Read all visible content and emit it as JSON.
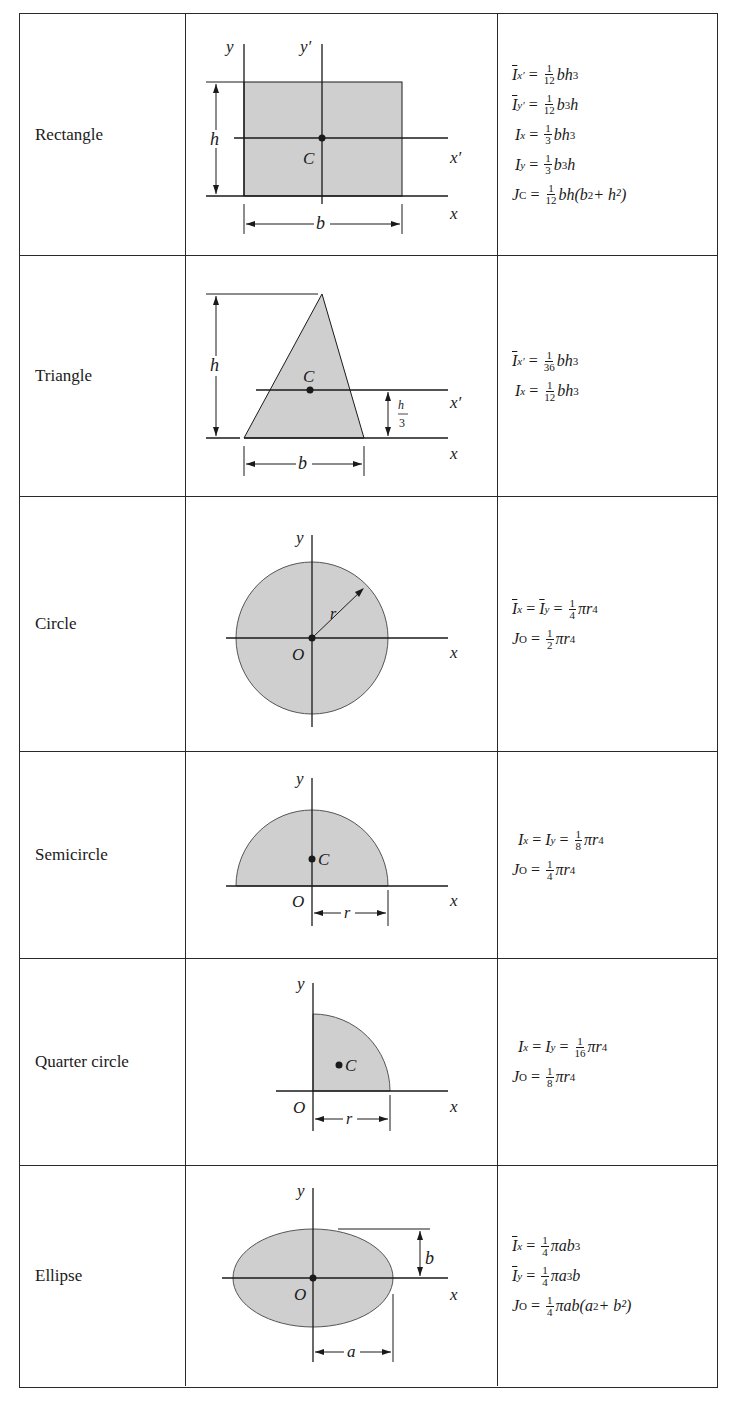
{
  "rows": [
    {
      "name": "Rectangle",
      "figure_labels": {
        "y": "y",
        "y_prime": "y′",
        "x": "x",
        "x_prime": "x′",
        "h": "h",
        "b": "b",
        "centroid": "C"
      },
      "formulas": [
        {
          "lhs": "I",
          "bar": true,
          "sub": "x′",
          "num": "1",
          "den": "12",
          "rhs": "bh",
          "rhs_sup": "3",
          "rhs_tail": ""
        },
        {
          "lhs": "I",
          "bar": true,
          "sub": "y′",
          "num": "1",
          "den": "12",
          "rhs": "b",
          "rhs_sup": "3",
          "rhs_tail": "h"
        },
        {
          "lhs": "I",
          "bar": false,
          "sub": "x",
          "num": "1",
          "den": "3",
          "rhs": "bh",
          "rhs_sup": "3",
          "rhs_tail": ""
        },
        {
          "lhs": "I",
          "bar": false,
          "sub": "y",
          "num": "1",
          "den": "3",
          "rhs": "b",
          "rhs_sup": "3",
          "rhs_tail": "h"
        },
        {
          "lhs": "J",
          "bar": false,
          "sub": "C",
          "num": "1",
          "den": "12",
          "rhs": "bh(b",
          "rhs_sup": "2",
          "rhs_tail": " + h²)"
        }
      ]
    },
    {
      "name": "Triangle",
      "figure_labels": {
        "x": "x",
        "x_prime": "x′",
        "h": "h",
        "b": "b",
        "centroid": "C",
        "h3_num": "h",
        "h3_den": "3"
      },
      "formulas": [
        {
          "lhs": "I",
          "bar": true,
          "sub": "x′",
          "num": "1",
          "den": "36",
          "rhs": "bh",
          "rhs_sup": "3",
          "rhs_tail": ""
        },
        {
          "lhs": "I",
          "bar": false,
          "sub": "x",
          "num": "1",
          "den": "12",
          "rhs": "bh",
          "rhs_sup": "3",
          "rhs_tail": ""
        }
      ]
    },
    {
      "name": "Circle",
      "figure_labels": {
        "y": "y",
        "x": "x",
        "r": "r",
        "origin": "O"
      },
      "formulas": [
        {
          "lhs": "I",
          "bar": true,
          "sub": "x",
          "mid": "= I̅",
          "mid_sub": "y",
          "num": "1",
          "den": "4",
          "rhs": "πr",
          "rhs_sup": "4",
          "rhs_tail": ""
        },
        {
          "lhs": "J",
          "bar": false,
          "sub": "O",
          "num": "1",
          "den": "2",
          "rhs": "πr",
          "rhs_sup": "4",
          "rhs_tail": ""
        }
      ]
    },
    {
      "name": "Semicircle",
      "figure_labels": {
        "y": "y",
        "x": "x",
        "r": "r",
        "origin": "O",
        "centroid": "C"
      },
      "formulas": [
        {
          "lhs": "I",
          "bar": false,
          "sub": "x",
          "mid": "= I",
          "mid_sub": "y",
          "num": "1",
          "den": "8",
          "rhs": "πr",
          "rhs_sup": "4",
          "rhs_tail": ""
        },
        {
          "lhs": "J",
          "bar": false,
          "sub": "O",
          "num": "1",
          "den": "4",
          "rhs": "πr",
          "rhs_sup": "4",
          "rhs_tail": ""
        }
      ]
    },
    {
      "name": "Quarter circle",
      "figure_labels": {
        "y": "y",
        "x": "x",
        "r": "r",
        "origin": "O",
        "centroid": "C"
      },
      "formulas": [
        {
          "lhs": "I",
          "bar": false,
          "sub": "x",
          "mid": "= I",
          "mid_sub": "y",
          "num": "1",
          "den": "16",
          "rhs": "πr",
          "rhs_sup": "4",
          "rhs_tail": ""
        },
        {
          "lhs": "J",
          "bar": false,
          "sub": "O",
          "num": "1",
          "den": "8",
          "rhs": "πr",
          "rhs_sup": "4",
          "rhs_tail": ""
        }
      ]
    },
    {
      "name": "Ellipse",
      "figure_labels": {
        "y": "y",
        "x": "x",
        "a": "a",
        "b": "b",
        "origin": "O"
      },
      "formulas": [
        {
          "lhs": "I",
          "bar": true,
          "sub": "x",
          "num": "1",
          "den": "4",
          "rhs": "πab",
          "rhs_sup": "3",
          "rhs_tail": ""
        },
        {
          "lhs": "I",
          "bar": true,
          "sub": "y",
          "num": "1",
          "den": "4",
          "rhs": "πa",
          "rhs_sup": "3",
          "rhs_tail": "b"
        },
        {
          "lhs": "J",
          "bar": false,
          "sub": "O",
          "num": "1",
          "den": "4",
          "rhs": "πab(a",
          "rhs_sup": "2",
          "rhs_tail": " + b²)"
        }
      ]
    }
  ],
  "colors": {
    "shape_fill": "#cfcfcf",
    "line": "#1a1a1a",
    "border": "#2a2a2a"
  }
}
